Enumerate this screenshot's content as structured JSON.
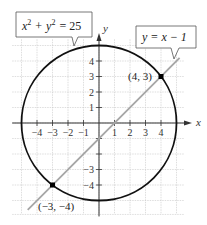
{
  "chart_data": {
    "type": "line",
    "title": "",
    "xlabel": "x",
    "ylabel": "y",
    "xlim": [
      -5.5,
      5.5
    ],
    "ylim": [
      -5.5,
      5.5
    ],
    "grid": true,
    "x_ticks": [
      -4,
      -3,
      -2,
      -1,
      1,
      2,
      3,
      4
    ],
    "y_ticks": [
      -4,
      -3,
      1,
      2,
      3,
      4
    ],
    "x_tick_labels": [
      "−4",
      "−3",
      "−2",
      "−1",
      "1",
      "2",
      "3",
      "4"
    ],
    "y_tick_labels": [
      "−4",
      "−3",
      "1",
      "2",
      "3",
      "4"
    ],
    "series": [
      {
        "name": "x² + y² = 25",
        "kind": "circle",
        "center": [
          0,
          0
        ],
        "radius": 5,
        "color": "#111111"
      },
      {
        "name": "y = x − 1",
        "kind": "line",
        "slope": 1,
        "intercept": -1,
        "x_range": [
          -4.6,
          5.2
        ],
        "color": "#a6a6a6"
      }
    ],
    "intersection_points": [
      {
        "x": 4,
        "y": 3,
        "label": "(4, 3)"
      },
      {
        "x": -3,
        "y": -4,
        "label": "(−3, −4)"
      }
    ],
    "annotations": [
      {
        "text": "x² + y² = 25",
        "target": "circle"
      },
      {
        "text": "y = x − 1",
        "target": "line"
      }
    ]
  },
  "labels": {
    "x_axis": "x",
    "y_axis": "y",
    "circle_eq_lhs": "x",
    "circle_eq_plus": "+",
    "circle_eq_y": "y",
    "circle_eq_rhs": "= 25",
    "circle_exp": "2",
    "line_eq": "y = x − 1",
    "point_a": "(4, 3)",
    "point_b": "(−3, −4)"
  }
}
